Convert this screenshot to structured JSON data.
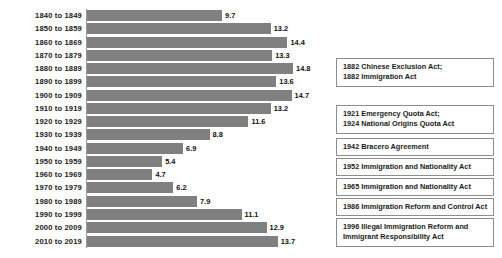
{
  "chart_data": {
    "type": "bar",
    "orientation": "horizontal",
    "title": "",
    "subtitle": "",
    "xlabel": "",
    "ylabel": "",
    "xlim": [
      0,
      15
    ],
    "grid": false,
    "legend": null,
    "bar_color": "#808080",
    "categories": [
      "1840 to 1849",
      "1850 to 1859",
      "1860 to 1869",
      "1870 to 1879",
      "1880 to 1889",
      "1890 to 1899",
      "1900 to 1909",
      "1910 to 1919",
      "1920 to 1929",
      "1930 to 1939",
      "1940 to 1949",
      "1950 to 1959",
      "1960 to 1969",
      "1970 to 1979",
      "1980 to 1989",
      "1990 to 1999",
      "2000 to 2009",
      "2010 to 2019"
    ],
    "values": [
      9.7,
      13.2,
      14.4,
      13.3,
      14.8,
      13.6,
      14.7,
      13.2,
      11.6,
      8.8,
      6.9,
      5.4,
      4.7,
      6.2,
      7.9,
      11.1,
      12.9,
      13.7
    ],
    "value_labels": [
      "9.7",
      "13.2",
      "14.4",
      "13.3",
      "14.8",
      "13.6",
      "14.7",
      "13.2",
      "11.6",
      "8.8",
      "6.9",
      "5.4",
      "4.7",
      "6.2",
      "7.9",
      "11.1",
      "12.9",
      "13.7"
    ],
    "annotations": [
      {
        "lines": [
          "1882 Chinese Exclusion Act;",
          "1882 Immigration Act"
        ]
      },
      {
        "lines": [
          "1921 Emergency Quota Act;",
          "1924 National Origins Quota Act"
        ]
      },
      {
        "lines": [
          "1942 Bracero Agreement"
        ]
      },
      {
        "lines": [
          "1952 Immigration and Nationality Act"
        ]
      },
      {
        "lines": [
          "1965 Immigration and Nationality Act"
        ]
      },
      {
        "lines": [
          "1986 Immigration Reform and Control Act"
        ]
      },
      {
        "lines": [
          "1996 Illegal Immigration Reform and",
          "Immigrant Responsibility Act"
        ]
      }
    ]
  }
}
